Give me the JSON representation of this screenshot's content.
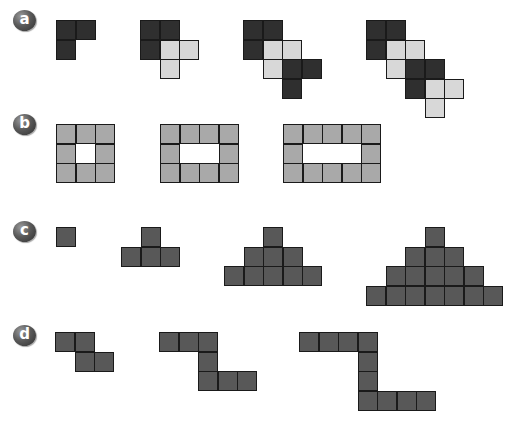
{
  "colors": {
    "dark": "#2f2f2f",
    "light": "#d8d8d8",
    "mid": "#a9a9a9",
    "grey": "#585858",
    "border": "#1a1a1a"
  },
  "patterns": [
    {
      "label": "a",
      "badge_pos": [
        13,
        10
      ],
      "figures": [
        {
          "origin": [
            56,
            20
          ],
          "cells": [
            [
              0,
              0,
              "dark"
            ],
            [
              1,
              0,
              "dark"
            ],
            [
              0,
              1,
              "dark"
            ]
          ]
        },
        {
          "origin": [
            140,
            20
          ],
          "cells": [
            [
              0,
              0,
              "dark"
            ],
            [
              1,
              0,
              "dark"
            ],
            [
              0,
              1,
              "dark"
            ],
            [
              1,
              1,
              "light"
            ],
            [
              2,
              1,
              "light"
            ],
            [
              1,
              2,
              "light"
            ]
          ]
        },
        {
          "origin": [
            243,
            20
          ],
          "cells": [
            [
              0,
              0,
              "dark"
            ],
            [
              1,
              0,
              "dark"
            ],
            [
              0,
              1,
              "dark"
            ],
            [
              1,
              1,
              "light"
            ],
            [
              2,
              1,
              "light"
            ],
            [
              1,
              2,
              "light"
            ],
            [
              2,
              2,
              "dark"
            ],
            [
              3,
              2,
              "dark"
            ],
            [
              2,
              3,
              "dark"
            ]
          ]
        },
        {
          "origin": [
            366,
            20
          ],
          "cells": [
            [
              0,
              0,
              "dark"
            ],
            [
              1,
              0,
              "dark"
            ],
            [
              0,
              1,
              "dark"
            ],
            [
              1,
              1,
              "light"
            ],
            [
              2,
              1,
              "light"
            ],
            [
              1,
              2,
              "light"
            ],
            [
              2,
              2,
              "dark"
            ],
            [
              3,
              2,
              "dark"
            ],
            [
              2,
              3,
              "dark"
            ],
            [
              3,
              3,
              "light"
            ],
            [
              4,
              3,
              "light"
            ],
            [
              3,
              4,
              "light"
            ]
          ]
        }
      ]
    },
    {
      "label": "b",
      "badge_pos": [
        13,
        114
      ],
      "figures": [
        {
          "origin": [
            56,
            124
          ],
          "cells": [
            [
              0,
              0,
              "mid"
            ],
            [
              1,
              0,
              "mid"
            ],
            [
              2,
              0,
              "mid"
            ],
            [
              0,
              1,
              "mid"
            ],
            [
              2,
              1,
              "mid"
            ],
            [
              0,
              2,
              "mid"
            ],
            [
              1,
              2,
              "mid"
            ],
            [
              2,
              2,
              "mid"
            ]
          ]
        },
        {
          "origin": [
            160,
            124
          ],
          "cells": [
            [
              0,
              0,
              "mid"
            ],
            [
              1,
              0,
              "mid"
            ],
            [
              2,
              0,
              "mid"
            ],
            [
              3,
              0,
              "mid"
            ],
            [
              0,
              1,
              "mid"
            ],
            [
              3,
              1,
              "mid"
            ],
            [
              0,
              2,
              "mid"
            ],
            [
              1,
              2,
              "mid"
            ],
            [
              2,
              2,
              "mid"
            ],
            [
              3,
              2,
              "mid"
            ]
          ]
        },
        {
          "origin": [
            283,
            124
          ],
          "cells": [
            [
              0,
              0,
              "mid"
            ],
            [
              1,
              0,
              "mid"
            ],
            [
              2,
              0,
              "mid"
            ],
            [
              3,
              0,
              "mid"
            ],
            [
              4,
              0,
              "mid"
            ],
            [
              0,
              1,
              "mid"
            ],
            [
              4,
              1,
              "mid"
            ],
            [
              0,
              2,
              "mid"
            ],
            [
              1,
              2,
              "mid"
            ],
            [
              2,
              2,
              "mid"
            ],
            [
              3,
              2,
              "mid"
            ],
            [
              4,
              2,
              "mid"
            ]
          ]
        }
      ]
    },
    {
      "label": "c",
      "badge_pos": [
        13,
        221
      ],
      "figures": [
        {
          "origin": [
            56,
            227
          ],
          "cells": [
            [
              0,
              0,
              "grey"
            ]
          ]
        },
        {
          "origin": [
            121,
            227
          ],
          "cells": [
            [
              1,
              0,
              "grey"
            ],
            [
              0,
              1,
              "grey"
            ],
            [
              1,
              1,
              "grey"
            ],
            [
              2,
              1,
              "grey"
            ]
          ]
        },
        {
          "origin": [
            224,
            227
          ],
          "cells": [
            [
              2,
              0,
              "grey"
            ],
            [
              1,
              1,
              "grey"
            ],
            [
              2,
              1,
              "grey"
            ],
            [
              3,
              1,
              "grey"
            ],
            [
              0,
              2,
              "grey"
            ],
            [
              1,
              2,
              "grey"
            ],
            [
              2,
              2,
              "grey"
            ],
            [
              3,
              2,
              "grey"
            ],
            [
              4,
              2,
              "grey"
            ]
          ]
        },
        {
          "origin": [
            366,
            227
          ],
          "cells": [
            [
              3,
              0,
              "grey"
            ],
            [
              2,
              1,
              "grey"
            ],
            [
              3,
              1,
              "grey"
            ],
            [
              4,
              1,
              "grey"
            ],
            [
              1,
              2,
              "grey"
            ],
            [
              2,
              2,
              "grey"
            ],
            [
              3,
              2,
              "grey"
            ],
            [
              4,
              2,
              "grey"
            ],
            [
              5,
              2,
              "grey"
            ],
            [
              0,
              3,
              "grey"
            ],
            [
              1,
              3,
              "grey"
            ],
            [
              2,
              3,
              "grey"
            ],
            [
              3,
              3,
              "grey"
            ],
            [
              4,
              3,
              "grey"
            ],
            [
              5,
              3,
              "grey"
            ],
            [
              6,
              3,
              "grey"
            ]
          ]
        }
      ]
    },
    {
      "label": "d",
      "badge_pos": [
        13,
        325
      ],
      "figures": [
        {
          "origin": [
            55,
            332
          ],
          "cells": [
            [
              0,
              0,
              "grey"
            ],
            [
              1,
              0,
              "grey"
            ],
            [
              1,
              1,
              "grey"
            ],
            [
              2,
              1,
              "grey"
            ]
          ]
        },
        {
          "origin": [
            159,
            332
          ],
          "cells": [
            [
              0,
              0,
              "grey"
            ],
            [
              1,
              0,
              "grey"
            ],
            [
              2,
              0,
              "grey"
            ],
            [
              2,
              1,
              "grey"
            ],
            [
              2,
              2,
              "grey"
            ],
            [
              3,
              2,
              "grey"
            ],
            [
              4,
              2,
              "grey"
            ]
          ]
        },
        {
          "origin": [
            299,
            332
          ],
          "cells": [
            [
              0,
              0,
              "grey"
            ],
            [
              1,
              0,
              "grey"
            ],
            [
              2,
              0,
              "grey"
            ],
            [
              3,
              0,
              "grey"
            ],
            [
              3,
              1,
              "grey"
            ],
            [
              3,
              2,
              "grey"
            ],
            [
              3,
              3,
              "grey"
            ],
            [
              4,
              3,
              "grey"
            ],
            [
              5,
              3,
              "grey"
            ],
            [
              6,
              3,
              "grey"
            ]
          ]
        }
      ]
    }
  ]
}
